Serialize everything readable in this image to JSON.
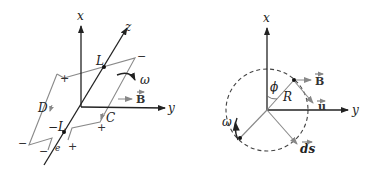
{
  "figure_left": {
    "labels": {
      "x_axis": "x",
      "y_axis": "y",
      "z_axis": "z",
      "point_top": "L",
      "point_bottom": "−L",
      "omega": "ω",
      "field": "B",
      "side_d": "D",
      "side_c": "C",
      "gap": "e"
    },
    "signs": {
      "top_left": "+",
      "top_right": "−",
      "bottom_left": "−",
      "bottom_inner_left": "−",
      "bottom_right": "+",
      "right_lower": "+"
    },
    "colors": {
      "axis": "#222222",
      "loop": "#8a8a8a"
    }
  },
  "figure_right": {
    "labels": {
      "x_axis": "x",
      "y_axis": "y",
      "angle": "ϕ",
      "radius": "R",
      "field": "B",
      "velocity": "u",
      "element": "ds",
      "omega": "ω"
    },
    "colors": {
      "axis": "#222222",
      "vector": "#8a8a8a",
      "circle": "#444444"
    }
  }
}
